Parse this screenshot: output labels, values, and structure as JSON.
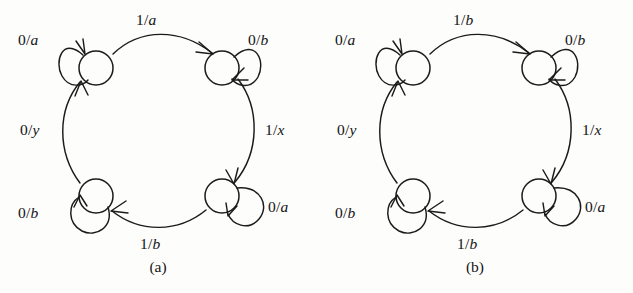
{
  "figure": {
    "type": "state-transition-diagram-pair",
    "background_color": "#fdfdfc",
    "ink_color": "#1b1b1b",
    "panels": [
      {
        "id": "a",
        "caption": "(a)",
        "nodes": [
          {
            "id": "top-left",
            "position": "top-left"
          },
          {
            "id": "top-right",
            "position": "top-right"
          },
          {
            "id": "bottom-right",
            "position": "bottom-right"
          },
          {
            "id": "bottom-left",
            "position": "bottom-left"
          }
        ],
        "self_loops": [
          {
            "id": "loop-top-left",
            "node": "top-left",
            "label": "0/a",
            "input": "0",
            "output": "a",
            "side": "left"
          },
          {
            "id": "loop-top-right",
            "node": "top-right",
            "label": "0/b",
            "input": "0",
            "output": "b",
            "side": "right"
          },
          {
            "id": "loop-bottom-right",
            "node": "bottom-right",
            "label": "0/a",
            "input": "0",
            "output": "a",
            "side": "right"
          },
          {
            "id": "loop-bottom-left",
            "node": "bottom-left",
            "label": "0/b",
            "input": "0",
            "output": "b",
            "side": "left"
          }
        ],
        "transitions": [
          {
            "id": "edge-top",
            "from": "top-left",
            "to": "top-right",
            "label": "1/a",
            "input": "1",
            "output": "a",
            "side": "top"
          },
          {
            "id": "edge-right",
            "from": "top-right",
            "to": "bottom-right",
            "label": "1/x",
            "input": "1",
            "output": "x",
            "side": "right"
          },
          {
            "id": "edge-bottom",
            "from": "bottom-right",
            "to": "bottom-left",
            "label": "1/b",
            "input": "1",
            "output": "b",
            "side": "bottom"
          },
          {
            "id": "edge-left",
            "from": "bottom-left",
            "to": "top-left",
            "label": "0/y",
            "input": "0",
            "output": "y",
            "side": "left"
          }
        ]
      },
      {
        "id": "b",
        "caption": "(b)",
        "nodes": [
          {
            "id": "top-left",
            "position": "top-left"
          },
          {
            "id": "top-right",
            "position": "top-right"
          },
          {
            "id": "bottom-right",
            "position": "bottom-right"
          },
          {
            "id": "bottom-left",
            "position": "bottom-left"
          }
        ],
        "self_loops": [
          {
            "id": "loop-top-left",
            "node": "top-left",
            "label": "0/a",
            "input": "0",
            "output": "a",
            "side": "left"
          },
          {
            "id": "loop-top-right",
            "node": "top-right",
            "label": "0/b",
            "input": "0",
            "output": "b",
            "side": "right"
          },
          {
            "id": "loop-bottom-right",
            "node": "bottom-right",
            "label": "0/a",
            "input": "0",
            "output": "a",
            "side": "right"
          },
          {
            "id": "loop-bottom-left",
            "node": "bottom-left",
            "label": "0/b",
            "input": "0",
            "output": "b",
            "side": "left"
          }
        ],
        "transitions": [
          {
            "id": "edge-top",
            "from": "top-left",
            "to": "top-right",
            "label": "1/b",
            "input": "1",
            "output": "b",
            "side": "top"
          },
          {
            "id": "edge-right",
            "from": "top-right",
            "to": "bottom-right",
            "label": "1/x",
            "input": "1",
            "output": "x",
            "side": "right"
          },
          {
            "id": "edge-bottom",
            "from": "bottom-right",
            "to": "bottom-left",
            "label": "1/b",
            "input": "1",
            "output": "b",
            "side": "bottom"
          },
          {
            "id": "edge-left",
            "from": "bottom-left",
            "to": "top-left",
            "label": "0/y",
            "input": "0",
            "output": "y",
            "side": "left"
          }
        ]
      }
    ]
  }
}
